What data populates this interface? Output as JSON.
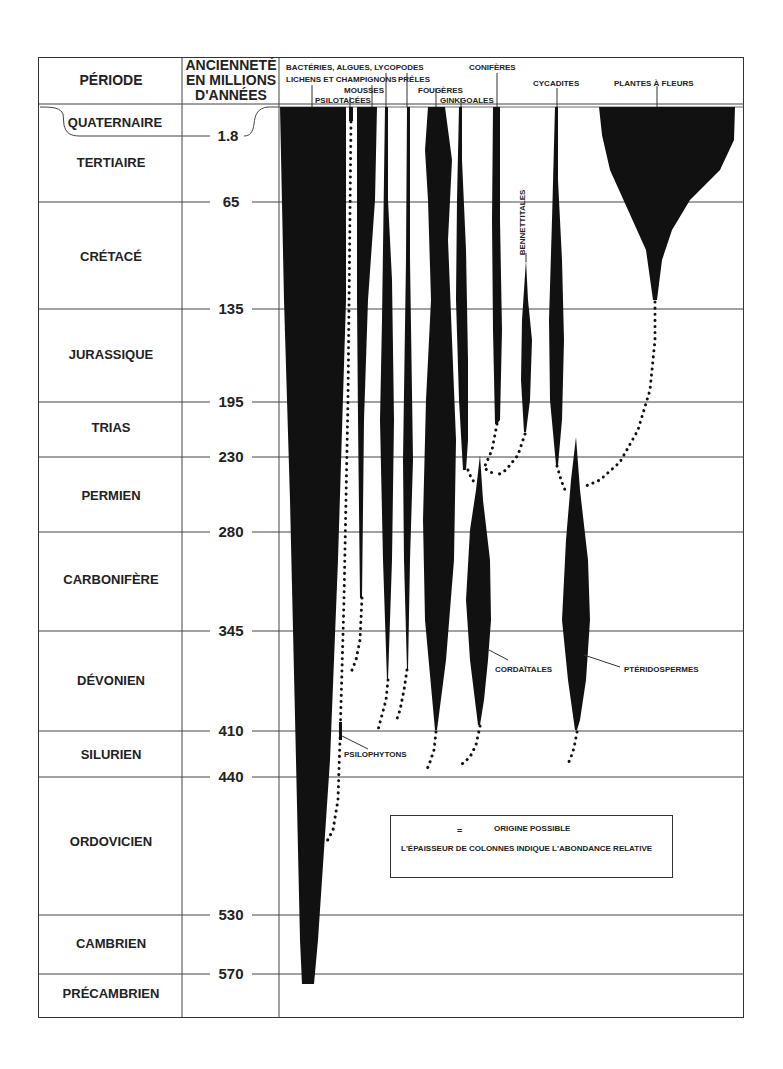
{
  "header": {
    "period_col": "PÉRIODE",
    "age_col_line1": "ANCIENNETÉ",
    "age_col_line2": "EN MILLIONS",
    "age_col_line3": "D'ANNÉES"
  },
  "periods": [
    {
      "name": "QUATERNAIRE",
      "boundary_age": "1.8"
    },
    {
      "name": "TERTIAIRE",
      "boundary_age": "65"
    },
    {
      "name": "CRÉTACÉ",
      "boundary_age": "135"
    },
    {
      "name": "JURASSIQUE",
      "boundary_age": "195"
    },
    {
      "name": "TRIAS",
      "boundary_age": "230"
    },
    {
      "name": "PERMIEN",
      "boundary_age": "280"
    },
    {
      "name": "CARBONIFÈRE",
      "boundary_age": "345"
    },
    {
      "name": "DÉVONIEN",
      "boundary_age": "410"
    },
    {
      "name": "SILURIEN",
      "boundary_age": "440"
    },
    {
      "name": "ORDOVICIEN",
      "boundary_age": "530"
    },
    {
      "name": "CAMBRIEN",
      "boundary_age": "570"
    },
    {
      "name": "PRÉCAMBRIEN",
      "boundary_age": ""
    }
  ],
  "groups": {
    "bacteries": "BACTÉRIES, ALGUES, LYCOPODES",
    "lichens": "LICHENS ET CHAMPIGNONS",
    "preles": "PRÊLES",
    "mousses": "MOUSSES",
    "psilotacees": "PSILOTACÉES",
    "fougeres": "FOUGÈRES",
    "ginkgoales": "GINKGOALES",
    "coniferes": "CONIFÈRES",
    "cycadites": "CYCADITES",
    "plantes_fleurs": "PLANTES À FLEURS",
    "bennettitales": "BENNETTITALES",
    "cordaitales": "CORDAÏTALES",
    "pteridospermes": "PTÉRIDOSPERMES",
    "psilophytons": "PSILOPHYTONS"
  },
  "legend": {
    "dots_meaning": "ORIGINE POSSIBLE",
    "equals": "=",
    "thickness_note": "L'ÉPAISSEUR DE COLONNES INDIQUE L'ABONDANCE RELATIVE"
  },
  "colors": {
    "ink": "#111111",
    "line": "#444444",
    "paper": "#ffffff"
  }
}
